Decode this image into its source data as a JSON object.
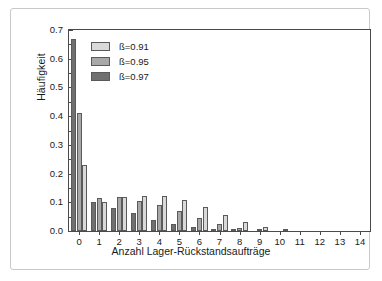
{
  "figure": {
    "border_color": "#c9c9c9",
    "background": "#ffffff"
  },
  "chart_data": {
    "type": "bar",
    "title": "",
    "subtitle": "",
    "xlabel": "Anzahl Lager-Rückstandsaufträge",
    "ylabel": "Häufigkeit",
    "categories": [
      "0",
      "1",
      "2",
      "3",
      "4",
      "5",
      "6",
      "7",
      "8",
      "9",
      "10",
      "11",
      "12",
      "13",
      "14"
    ],
    "x_tick_labels": [
      "0",
      "1",
      "2",
      "3",
      "4",
      "5",
      "6",
      "7",
      "8",
      "9",
      "10",
      "11",
      "12",
      "13",
      "14"
    ],
    "y_tick_labels": [
      "0.0",
      "0.1",
      "0.2",
      "0.3",
      "0.4",
      "0.5",
      "0.6",
      "0.7"
    ],
    "y_tick_values": [
      0.0,
      0.1,
      0.2,
      0.3,
      0.4,
      0.5,
      0.6,
      0.7
    ],
    "ylim": [
      0.0,
      0.7
    ],
    "xlim": [
      -0.5,
      14.5
    ],
    "grid": false,
    "legend_position": "upper-left-inside",
    "bar_order_in_group": [
      "ß=0.97",
      "ß=0.95",
      "ß=0.91"
    ],
    "series": [
      {
        "name": "ß=0.91",
        "color": "#d9d9d9",
        "values": [
          0.23,
          0.1,
          0.118,
          0.123,
          0.122,
          0.108,
          0.085,
          0.057,
          0.033,
          0.015,
          0.007,
          0.002,
          0.001,
          0.0,
          0.0
        ]
      },
      {
        "name": "ß=0.95",
        "color": "#a8a8a8",
        "values": [
          0.41,
          0.115,
          0.118,
          0.105,
          0.09,
          0.07,
          0.045,
          0.024,
          0.011,
          0.005,
          0.002,
          0.001,
          0.0,
          0.0,
          0.0
        ]
      },
      {
        "name": "ß=0.97",
        "color": "#707070",
        "values": [
          0.67,
          0.1,
          0.08,
          0.062,
          0.04,
          0.023,
          0.013,
          0.007,
          0.003,
          0.001,
          0.0,
          0.0,
          0.0,
          0.0,
          0.0
        ]
      }
    ]
  },
  "legend": {
    "items": [
      {
        "label": "ß=0.91",
        "color": "#d9d9d9"
      },
      {
        "label": "ß=0.95",
        "color": "#a8a8a8"
      },
      {
        "label": "ß=0.97",
        "color": "#707070"
      }
    ]
  }
}
